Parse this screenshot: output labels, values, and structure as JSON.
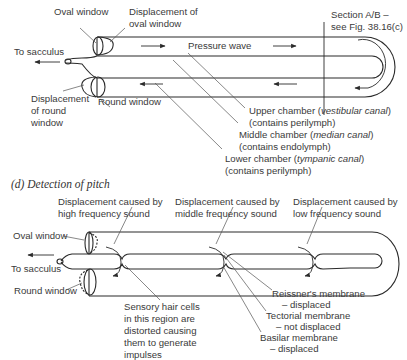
{
  "top_diagram": {
    "labels": {
      "oval_window": "Oval window",
      "displacement_oval_1": "Displacement of",
      "displacement_oval_2": "oval window",
      "to_sacculus": "To sacculus",
      "pressure_wave": "Pressure wave",
      "section_1": "Section A/B –",
      "section_2": "see Fig. 38.16(c)",
      "displacement_round_1": "Displacement",
      "displacement_round_2": "of round",
      "displacement_round_3": "window",
      "round_window": "Round window",
      "upper_chamber_a": "Upper chamber (",
      "upper_chamber_it": "vestibular canal",
      "upper_chamber_b": ")",
      "upper_chamber_2": "(contains perilymph)",
      "middle_chamber_a": "Middle chamber (",
      "middle_chamber_it": "median canal",
      "middle_chamber_b": ")",
      "middle_chamber_2": "(contains endolymph)",
      "lower_chamber_a": "Lower chamber (",
      "lower_chamber_it": "tympanic canal",
      "lower_chamber_b": ")",
      "lower_chamber_2": "(contains perilymph)"
    }
  },
  "bottom_diagram": {
    "heading_letter": "(d)",
    "heading": "Detection of pitch",
    "labels": {
      "high_1": "Displacement caused by",
      "high_2": "high frequency sound",
      "mid_1": "Displacement caused by",
      "mid_2": "middle frequency sound",
      "low_1": "Displacement caused by",
      "low_2": "low frequency sound",
      "oval_window": "Oval window",
      "to_sacculus": "To sacculus",
      "round_window": "Round window",
      "hair_1": "Sensory hair cells",
      "hair_2": "in this region are",
      "hair_3": "distorted causing",
      "hair_4": "them to generate",
      "hair_5": "impulses",
      "reissner_1": "Reissner's membrane",
      "reissner_2": "– displaced",
      "tectorial_1": "Tectorial membrane",
      "tectorial_2": "– not displaced",
      "basilar_1": "Basilar membrane",
      "basilar_2": "– displaced"
    }
  },
  "colors": {
    "line": "#2a2a2a",
    "leader": "#555555",
    "text": "#3a3a3a"
  }
}
